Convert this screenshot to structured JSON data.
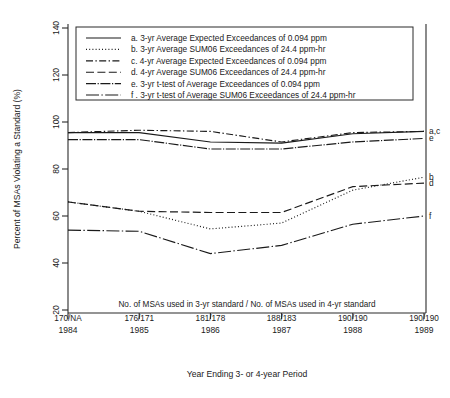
{
  "chart_data": {
    "type": "line",
    "title": "",
    "xlabel": "Year Ending 3- or 4-year Period",
    "ylabel": "Percent of MSAs Violating a Standard (%)",
    "x": [
      1984,
      1985,
      1986,
      1987,
      1988,
      1989
    ],
    "xtick_labels": [
      "1984",
      "1985",
      "1986",
      "1987",
      "1988",
      "1989"
    ],
    "ytick_labels": [
      "20",
      "40",
      "60",
      "80",
      "100",
      "120",
      "140"
    ],
    "ytick_values": [
      20,
      40,
      60,
      80,
      100,
      120,
      140
    ],
    "ylim": [
      20,
      140
    ],
    "xlim": [
      1984,
      1989
    ],
    "grid": false,
    "legend_position": "top-inside",
    "secondary_axis_note": "No. of MSAs used in 3-yr standard / No. of MSAs used in 4-yr standard",
    "msa_counts": [
      "170/NA",
      "176/171",
      "181/178",
      "188/183",
      "190/190",
      "190/190"
    ],
    "series": [
      {
        "key": "a",
        "name": "a. 3-yr Average Expected Exceedances of 0.094 ppm",
        "style": "solid",
        "end_label": "a,c",
        "values": [
          95.5,
          95.5,
          91.5,
          91.0,
          95.0,
          96.0
        ]
      },
      {
        "key": "b",
        "name": "b. 3-yr Average SUM06 Exceedances of 24.4 ppm-hr",
        "style": "dotted",
        "end_label": "b",
        "values": [
          66.0,
          62.0,
          54.5,
          57.0,
          71.0,
          76.5
        ]
      },
      {
        "key": "c",
        "name": "c. 4-yr Average Expected Exceedances of 0.094 ppm",
        "style": "dashdot",
        "end_label": "a,c",
        "values": [
          95.5,
          96.5,
          96.0,
          91.5,
          95.5,
          96.0
        ]
      },
      {
        "key": "d",
        "name": "d. 4-yr Average SUM06 Exceedances of 24.4 ppm-hr",
        "style": "dashed",
        "end_label": "d",
        "values": [
          66.0,
          62.0,
          61.5,
          61.5,
          72.5,
          74.0
        ]
      },
      {
        "key": "e",
        "name": "e. 3-yr t-test of Average Exceedances of 0.094 ppm",
        "style": "solid-dotted",
        "end_label": "e",
        "values": [
          92.5,
          92.5,
          88.5,
          88.5,
          91.5,
          93.0
        ]
      },
      {
        "key": "f",
        "name": "f . 3-yr t-test of Average SUM06 Exceedances of 24.4 ppm-hr",
        "style": "long-dashdot",
        "end_label": "f",
        "values": [
          54.0,
          53.5,
          44.0,
          47.5,
          56.5,
          60.0
        ]
      }
    ]
  },
  "axes": {
    "ylabel": "Percent of MSAs Violating a Standard (%)",
    "xlabel": "Year Ending 3- or 4-year Period",
    "msa_header": "No. of MSAs used in 3-yr standard / No. of MSAs used in 4-yr standard"
  },
  "legend": {
    "items": [
      "a. 3-yr Average Expected Exceedances of 0.094 ppm",
      "b. 3-yr Average SUM06 Exceedances of 24.4 ppm-hr",
      "c. 4-yr Average Expected Exceedances of 0.094 ppm",
      "d. 4-yr Average SUM06 Exceedances of 24.4 ppm-hr",
      "e. 3-yr t-test of Average Exceedances of 0.094 ppm",
      "f . 3-yr t-test of Average SUM06 Exceedances of 24.4 ppm-hr"
    ]
  }
}
